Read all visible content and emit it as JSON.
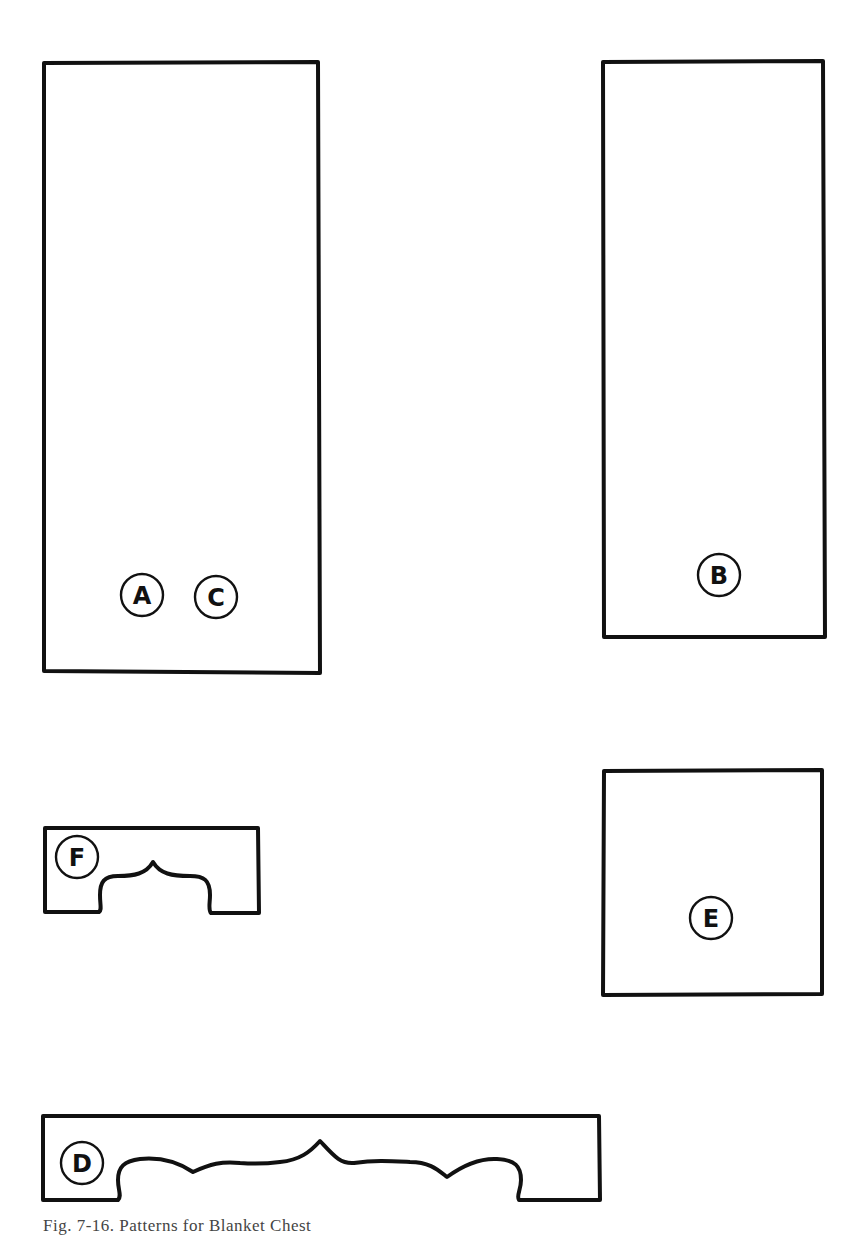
{
  "figure": {
    "caption": "Fig. 7-16. Patterns for Blanket Chest",
    "stroke_color": "#111111",
    "background_color": "#ffffff"
  },
  "pieces": [
    {
      "id": "A",
      "label": "A",
      "shape": "rectangle",
      "description": "Large tall rectangle panel (shared with C)"
    },
    {
      "id": "C",
      "label": "C",
      "shape": "rectangle",
      "description": "Shares pattern with A"
    },
    {
      "id": "B",
      "label": "B",
      "shape": "rectangle",
      "description": "Tall narrow rectangle panel"
    },
    {
      "id": "E",
      "label": "E",
      "shape": "rectangle",
      "description": "Near-square panel"
    },
    {
      "id": "F",
      "label": "F",
      "shape": "apron",
      "description": "Short apron with scalloped cutout and central peak"
    },
    {
      "id": "D",
      "label": "D",
      "shape": "apron",
      "description": "Long apron with scalloped cutout and central peak"
    }
  ]
}
